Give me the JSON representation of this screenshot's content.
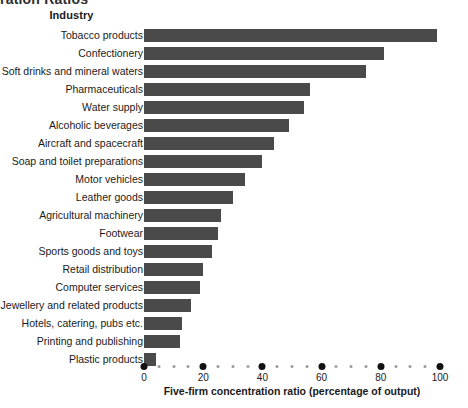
{
  "title_fragment": "ration Ratios",
  "chart_data": {
    "type": "bar",
    "orientation": "horizontal",
    "title": "ration Ratios",
    "xlabel": "Five-firm concentration ratio (percentage of output)",
    "ylabel": "Industry",
    "xlim": [
      0,
      100
    ],
    "xticks": [
      0,
      20,
      40,
      60,
      80,
      100
    ],
    "xticklabels": [
      "0",
      "20",
      "40",
      "60",
      "80",
      "100"
    ],
    "minor_tick_step": 5,
    "grid": false,
    "legend": "none",
    "bar_color": "#4a4a4a",
    "background_color": "#ffffff",
    "categories": [
      "Tobacco products",
      "Confectionery",
      "Soft drinks and mineral waters",
      "Pharmaceuticals",
      "Water supply",
      "Alcoholic beverages",
      "Aircraft and spacecraft",
      "Soap and toilet preparations",
      "Motor vehicles",
      "Leather goods",
      "Agricultural machinery",
      "Footwear",
      "Sports goods and toys",
      "Retail distribution",
      "Computer services",
      "Jewellery and related products",
      "Hotels, catering, pubs etc.",
      "Printing and publishing",
      "Plastic products"
    ],
    "values": [
      99,
      81,
      75,
      56,
      54,
      49,
      44,
      40,
      34,
      30,
      26,
      25,
      23,
      20,
      19,
      16,
      13,
      12,
      4
    ]
  }
}
